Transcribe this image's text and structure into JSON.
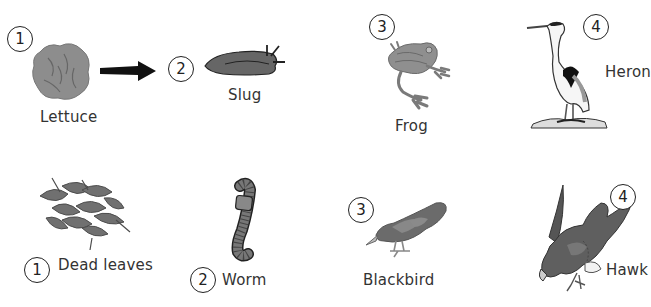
{
  "chains": [
    {
      "name": "garden-food-chain",
      "items": [
        {
          "number": "1",
          "label": "Lettuce",
          "icon": "lettuce-icon"
        },
        {
          "number": "2",
          "label": "Slug",
          "icon": "slug-icon"
        },
        {
          "number": "3",
          "label": "Frog",
          "icon": "frog-icon"
        },
        {
          "number": "4",
          "label": "Heron",
          "icon": "heron-icon"
        }
      ],
      "arrow": "arrow-right-icon"
    },
    {
      "name": "woodland-food-chain",
      "items": [
        {
          "number": "1",
          "label": "Dead leaves",
          "icon": "dead-leaves-icon"
        },
        {
          "number": "2",
          "label": "Worm",
          "icon": "worm-icon"
        },
        {
          "number": "3",
          "label": "Blackbird",
          "icon": "blackbird-icon"
        },
        {
          "number": "4",
          "label": "Hawk",
          "icon": "hawk-icon"
        }
      ]
    }
  ],
  "colors": {
    "organism_fill": "#8a8a8a",
    "dark_fill": "#555555",
    "outline": "#222222",
    "text": "#333333"
  }
}
